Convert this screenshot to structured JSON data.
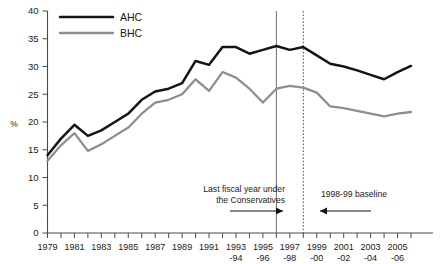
{
  "chart_data": {
    "type": "line",
    "title": "",
    "subtitle": "",
    "xlabel": "",
    "ylabel": "%",
    "ylim": [
      0,
      40
    ],
    "ytick_values": [
      0,
      5,
      10,
      15,
      20,
      25,
      30,
      35,
      40
    ],
    "ytick_labels": [
      "0",
      "5",
      "10",
      "15",
      "20",
      "25",
      "30",
      "35",
      "40"
    ],
    "grid": false,
    "legend_position": "top-left",
    "x": [
      1979,
      1980,
      1981,
      1982,
      1983,
      1984,
      1985,
      1986,
      1987,
      1988,
      1989,
      1990,
      1991,
      1992,
      1993,
      1994,
      1995,
      1996,
      1997,
      1998,
      1999,
      2000,
      2001,
      2002,
      2003,
      2004,
      2005,
      2006
    ],
    "xtick_labels": [
      {
        "line1": "1979",
        "line2": ""
      },
      {
        "line1": "",
        "line2": ""
      },
      {
        "line1": "1981",
        "line2": ""
      },
      {
        "line1": "",
        "line2": ""
      },
      {
        "line1": "1983",
        "line2": ""
      },
      {
        "line1": "",
        "line2": ""
      },
      {
        "line1": "1985",
        "line2": ""
      },
      {
        "line1": "",
        "line2": ""
      },
      {
        "line1": "1987",
        "line2": ""
      },
      {
        "line1": "",
        "line2": ""
      },
      {
        "line1": "1989",
        "line2": ""
      },
      {
        "line1": "",
        "line2": ""
      },
      {
        "line1": "1991",
        "line2": ""
      },
      {
        "line1": "",
        "line2": ""
      },
      {
        "line1": "1993",
        "line2": "-94"
      },
      {
        "line1": "",
        "line2": ""
      },
      {
        "line1": "1995",
        "line2": "-96"
      },
      {
        "line1": "",
        "line2": ""
      },
      {
        "line1": "1997",
        "line2": "-98"
      },
      {
        "line1": "",
        "line2": ""
      },
      {
        "line1": "1999",
        "line2": "-00"
      },
      {
        "line1": "",
        "line2": ""
      },
      {
        "line1": "2001",
        "line2": "-02"
      },
      {
        "line1": "",
        "line2": ""
      },
      {
        "line1": "2003",
        "line2": "-04"
      },
      {
        "line1": "",
        "line2": ""
      },
      {
        "line1": "2005",
        "line2": "-06"
      },
      {
        "line1": "",
        "line2": ""
      }
    ],
    "series": [
      {
        "name": "AHC",
        "color": "#141414",
        "values": [
          14.0,
          17.0,
          19.5,
          17.5,
          18.5,
          20.0,
          21.5,
          24.0,
          25.5,
          26.0,
          27.0,
          31.0,
          30.3,
          33.5,
          33.5,
          32.3,
          33.0,
          33.7,
          33.0,
          33.5,
          32.0,
          30.5,
          30.0,
          29.3,
          28.5,
          27.7,
          29.0,
          30.1
        ]
      },
      {
        "name": "BHC",
        "color": "#8e8e8e",
        "values": [
          13.0,
          15.8,
          18.0,
          14.8,
          16.0,
          17.5,
          19.0,
          21.5,
          23.5,
          24.0,
          25.0,
          27.7,
          25.6,
          29.0,
          28.0,
          26.0,
          23.5,
          26.0,
          26.5,
          26.2,
          25.3,
          22.8,
          22.5,
          22.0,
          21.5,
          21.0,
          21.5,
          21.8
        ]
      }
    ],
    "annotations": [
      {
        "id": "conservatives",
        "line1": "Last fiscal year under",
        "line2": "the Conservatives",
        "arrow_direction": "right",
        "marker_x": 1996,
        "marker_style": "solid"
      },
      {
        "id": "baseline",
        "line1": "1998-99 baseline",
        "line2": "",
        "arrow_direction": "left",
        "marker_x": 1998,
        "marker_style": "dotted"
      }
    ]
  }
}
